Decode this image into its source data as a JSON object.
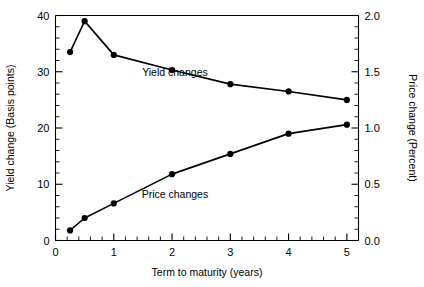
{
  "chart_data": {
    "type": "line",
    "title": "",
    "xlabel": "Term to maturity (years)",
    "ylabel": "Yield change (Basis points)",
    "y2label": "Price change (Percent)",
    "xlim": [
      0,
      5.2
    ],
    "ylim": [
      0,
      40
    ],
    "y2lim": [
      0.0,
      2.0
    ],
    "grid": false,
    "legend_position": "inline-annotation",
    "x_ticks": [
      0,
      1,
      2,
      3,
      4,
      5
    ],
    "x_tick_labels": [
      "0",
      "1",
      "2",
      "3",
      "4",
      "5"
    ],
    "x_minor_step": 0.2,
    "y_ticks": [
      0,
      10,
      20,
      30,
      40
    ],
    "y_tick_labels": [
      "0",
      "10",
      "20",
      "30",
      "40"
    ],
    "y_minor_step": 2,
    "y2_ticks": [
      0.0,
      0.5,
      1.0,
      1.5,
      2.0
    ],
    "y2_tick_labels": [
      "0.0",
      "0.5",
      "1.0",
      "1.5",
      "2.0"
    ],
    "y2_minor_step": 0.1,
    "x": [
      0.25,
      0.5,
      1,
      2,
      3,
      4,
      5
    ],
    "series": [
      {
        "name": "Yield changes",
        "axis": "left",
        "units": "Basis points",
        "values": [
          33.5,
          39.0,
          33.0,
          30.3,
          27.8,
          26.5,
          25.0
        ],
        "label_x": 2.05,
        "label_y": 29.2
      },
      {
        "name": "Price changes",
        "axis": "right",
        "units": "Percent",
        "values": [
          0.09,
          0.2,
          0.33,
          0.59,
          0.77,
          0.95,
          1.03
        ],
        "label_x": 2.05,
        "label_y": 7.6
      }
    ],
    "colors": {
      "line": "#000000",
      "marker": "#000000",
      "axis": "#000000",
      "background": "#ffffff"
    }
  }
}
